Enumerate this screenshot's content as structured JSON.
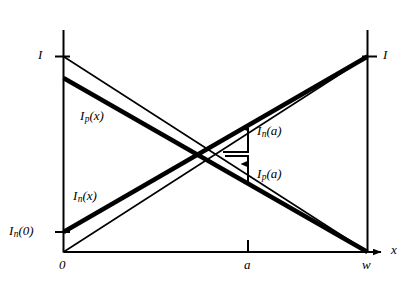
{
  "figure": {
    "type": "line-diagram",
    "background_color": "#ffffff",
    "ink_color": "#000000"
  },
  "axes": {
    "x_axis_label": "x",
    "origin_label": "0",
    "x_ticks": [
      {
        "name": "origin",
        "label": "0",
        "x": 0
      },
      {
        "name": "a",
        "label": "a",
        "x": 0.606
      },
      {
        "name": "w",
        "label": "w",
        "x": 1.0
      }
    ],
    "y_ticks": [
      {
        "name": "I-left",
        "label": "I",
        "y": 1.0
      },
      {
        "name": "In0",
        "label_main": "I",
        "label_sub": "n",
        "label_tail": "(0)",
        "y": 0.102
      }
    ],
    "right_ticks": [
      {
        "name": "I-right",
        "label": "I",
        "y": 1.0
      }
    ]
  },
  "curves": [
    {
      "name": "Ip-x-thin",
      "style": "thin",
      "from": {
        "x": 0.0,
        "y": 1.0
      },
      "to": {
        "x": 1.0,
        "y": 0.0
      }
    },
    {
      "name": "Ip-x-thick",
      "style": "thick",
      "from": {
        "x": 0.0,
        "y": 0.888
      },
      "to": {
        "x": 1.0,
        "y": 0.0
      }
    },
    {
      "name": "In-x-thin",
      "style": "thin",
      "from": {
        "x": 0.0,
        "y": 0.0
      },
      "to": {
        "x": 1.0,
        "y": 1.0
      }
    },
    {
      "name": "In-x-thick",
      "style": "thick",
      "from": {
        "x": 0.0,
        "y": 0.102
      },
      "to": {
        "x": 1.0,
        "y": 1.0
      }
    }
  ],
  "curve_labels": [
    {
      "name": "Ip-x-label",
      "main": "I",
      "sub": "p",
      "tail": "(x)"
    },
    {
      "name": "In-x-label",
      "main": "I",
      "sub": "n",
      "tail": "(x)"
    }
  ],
  "annotations": [
    {
      "name": "In-a-annotation",
      "main": "I",
      "sub": "n",
      "tail": "(a)",
      "arrow": "up",
      "at_x": 0.606
    },
    {
      "name": "Ip-a-annotation",
      "main": "I",
      "sub": "p",
      "tail": "(a)",
      "arrow": "up",
      "at_x": 0.606
    }
  ],
  "tick_labels": {
    "origin": "0",
    "a": "a",
    "w": "w",
    "I_left": "I",
    "I_right": "I",
    "x_axis": "x"
  },
  "in0_label": {
    "main": "I",
    "sub": "n",
    "tail": "(0)"
  }
}
